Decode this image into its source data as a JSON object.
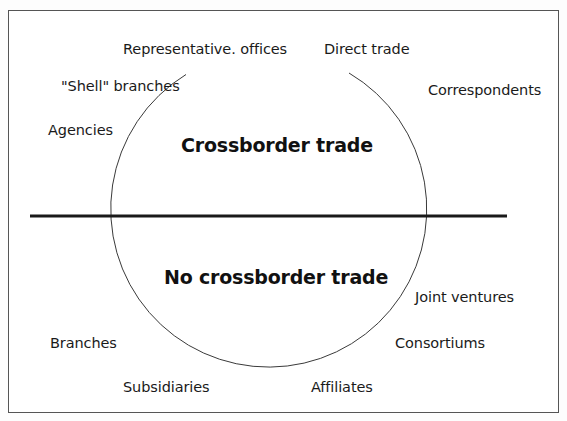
{
  "diagram": {
    "type": "circle-split-by-line",
    "regions": {
      "above_line": {
        "heading": "Crossborder trade"
      },
      "below_line": {
        "heading": "No crossborder trade"
      }
    },
    "labels": {
      "representative_offices": "Representative. offices",
      "direct_trade": "Direct trade",
      "shell_branches": "\"Shell\" branches",
      "correspondents": "Correspondents",
      "agencies": "Agencies",
      "joint_ventures": "Joint ventures",
      "branches": "Branches",
      "consortiums": "Consortiums",
      "subsidiaries": "Subsidiaries",
      "affiliates": "Affiliates"
    },
    "nodes": [
      {
        "id": "representative_offices",
        "label": "Representative. offices",
        "position": "top-left",
        "region": "crossborder"
      },
      {
        "id": "direct_trade",
        "label": "Direct trade",
        "position": "top-right",
        "region": "crossborder"
      },
      {
        "id": "shell_branches",
        "label": "\"Shell\" branches",
        "position": "upper-left",
        "region": "crossborder"
      },
      {
        "id": "correspondents",
        "label": "Correspondents",
        "position": "upper-right",
        "region": "crossborder"
      },
      {
        "id": "agencies",
        "label": "Agencies",
        "position": "left",
        "region": "crossborder"
      },
      {
        "id": "joint_ventures",
        "label": "Joint ventures",
        "position": "lower-right",
        "region": "no-crossborder"
      },
      {
        "id": "branches",
        "label": "Branches",
        "position": "lower-left",
        "region": "no-crossborder"
      },
      {
        "id": "consortiums",
        "label": "Consortiums",
        "position": "lower-right",
        "region": "no-crossborder"
      },
      {
        "id": "subsidiaries",
        "label": "Subsidiaries",
        "position": "bottom-left",
        "region": "no-crossborder"
      },
      {
        "id": "affiliates",
        "label": "Affiliates",
        "position": "bottom-right",
        "region": "no-crossborder"
      }
    ],
    "colors": {
      "line": "#1a1a1a",
      "circle": "#3a3a3a",
      "frame": "#555555",
      "text": "#1a1a1a"
    }
  }
}
